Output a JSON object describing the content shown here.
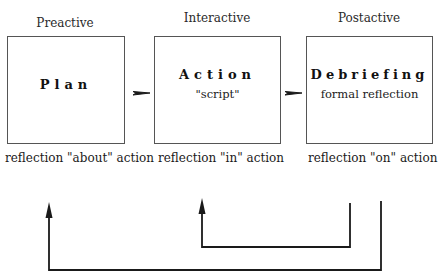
{
  "diagram": {
    "phases": [
      {
        "label": "Preactive",
        "title": "Plan",
        "subtitle": "",
        "reflection": "reflection \"about\" action"
      },
      {
        "label": "Interactive",
        "title": "Action",
        "subtitle": "\"script\"",
        "reflection": "reflection \"in\" action"
      },
      {
        "label": "Postactive",
        "title": "Debriefing",
        "subtitle": "formal reflection",
        "reflection": "reflection \"on\" action"
      }
    ],
    "colors": {
      "box_border": "#555555",
      "arrow": "#1a1a1a",
      "background": "#ffffff"
    },
    "flow_arrows": [
      {
        "from": "Plan",
        "to": "Action"
      },
      {
        "from": "Action",
        "to": "Debriefing"
      }
    ],
    "feedback_loops": [
      {
        "from": "Debriefing",
        "to": "Action",
        "type": "inner-loop"
      },
      {
        "from": "Debriefing",
        "to": "Plan",
        "type": "outer-loop"
      }
    ]
  }
}
